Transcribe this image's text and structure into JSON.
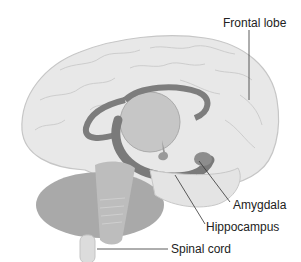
{
  "diagram": {
    "labels": {
      "frontal_lobe": "Frontal lobe",
      "amygdala": "Amygdala",
      "hippocampus": "Hippocampus",
      "spinal_cord": "Spinal cord"
    },
    "colors": {
      "cortex": "#e6e6e6",
      "cortex_outline": "#c4c4c4",
      "limbic": "#7d7d7d",
      "cerebellum": "#a8a8a8",
      "brainstem": "#bdbdbd",
      "leader_line": "#333333"
    }
  }
}
